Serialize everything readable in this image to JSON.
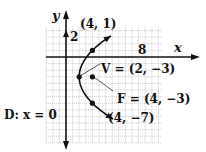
{
  "figure": {
    "type": "parabola-diagram",
    "axes": {
      "x_label": "x",
      "y_label": "y",
      "x_tick_label": "8",
      "y_tick_label": "2"
    },
    "grid": {
      "xmin": -3,
      "xmax": 14.5,
      "ymin": -13,
      "ymax": 4.5,
      "unit": 1
    },
    "points": [
      {
        "name": "upper-point",
        "x": 4,
        "y": 1,
        "label": "(4, 1)"
      },
      {
        "name": "vertex",
        "x": 2,
        "y": -3,
        "label": "V = (2, −3)"
      },
      {
        "name": "focus",
        "x": 4,
        "y": -3,
        "label": "F = (4, −3)"
      },
      {
        "name": "lower-point",
        "x": 4,
        "y": -7,
        "label": "(4, −7)"
      }
    ],
    "directrix": {
      "label": "D: x = 0"
    },
    "colors": {
      "ink": "#111111",
      "grid": "#9a9a9a",
      "background": "#ffffff"
    }
  }
}
